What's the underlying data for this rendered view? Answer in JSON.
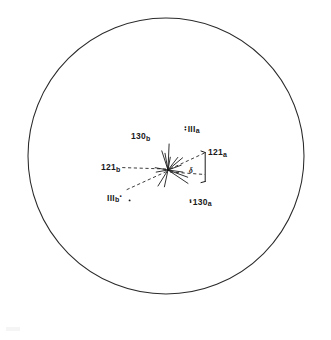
{
  "figure": {
    "kind": "stereographic-projection",
    "background_color": "#ffffff",
    "line_color": "#1a1a1a",
    "circle": {
      "center_x": 166,
      "center_y": 156,
      "radius": 138,
      "stroke_width": 1
    },
    "origin": {
      "x": 168,
      "y": 170,
      "label": "central-pole"
    },
    "labels": [
      {
        "id": "130b",
        "text": "130",
        "subscript": "b",
        "lead_dot": "",
        "dot_side": "none",
        "x": 131,
        "y": 132
      },
      {
        "id": "111a",
        "text": "III",
        "subscript": "a",
        "lead_dot": "·",
        "dot_side": "left",
        "x": 184,
        "y": 123
      },
      {
        "id": "121a",
        "text": "121",
        "subscript": "a",
        "lead_dot": "",
        "dot_side": "none",
        "x": 208,
        "y": 148
      },
      {
        "id": "121b",
        "text": "121",
        "subscript": "b",
        "lead_dot": "",
        "dot_side": "none",
        "x": 101,
        "y": 163
      },
      {
        "id": "111b",
        "text": "III",
        "subscript": "b",
        "lead_dot": "·",
        "dot_side": "right",
        "x": 107,
        "y": 192
      },
      {
        "id": "130a",
        "text": "130",
        "subscript": "a",
        "lead_dot": "·",
        "dot_side": "left",
        "x": 189,
        "y": 196
      }
    ],
    "angle_marker": {
      "symbol": "δ",
      "x": 189,
      "y": 167,
      "bracket_x": 205,
      "bracket_top_y": 152,
      "bracket_bottom_y": 182
    },
    "star_rays": [
      {
        "id": "ray-n",
        "angle_deg": 268,
        "length": 26
      },
      {
        "id": "ray-nne",
        "angle_deg": 252,
        "length": 20
      },
      {
        "id": "ray-ne",
        "angle_deg": 214,
        "length": 24
      },
      {
        "id": "ray-ene",
        "angle_deg": 200,
        "length": 21
      },
      {
        "id": "ray-e",
        "angle_deg": 188,
        "length": 15
      },
      {
        "id": "ray-ese",
        "angle_deg": 160,
        "length": 14
      },
      {
        "id": "ray-se",
        "angle_deg": 140,
        "length": 19
      },
      {
        "id": "ray-s",
        "angle_deg": 100,
        "length": 17
      },
      {
        "id": "ray-ssw",
        "angle_deg": 80,
        "length": 13
      },
      {
        "id": "ray-sw",
        "angle_deg": 52,
        "length": 16
      },
      {
        "id": "ray-w",
        "angle_deg": 10,
        "length": 13
      },
      {
        "id": "ray-wnw",
        "angle_deg": 350,
        "length": 12
      }
    ],
    "dashed_connectors": [
      {
        "id": "dash-to-121b",
        "from": "origin",
        "to_x": 120,
        "to_y": 167
      },
      {
        "id": "dash-to-111b",
        "from": "origin",
        "to_x": 127,
        "to_y": 190
      },
      {
        "id": "dash-to-121a",
        "from": "origin",
        "to_x": 204,
        "to_y": 153
      },
      {
        "id": "dash-to-130a",
        "from": "origin",
        "to_x": 205,
        "to_y": 175
      }
    ]
  }
}
